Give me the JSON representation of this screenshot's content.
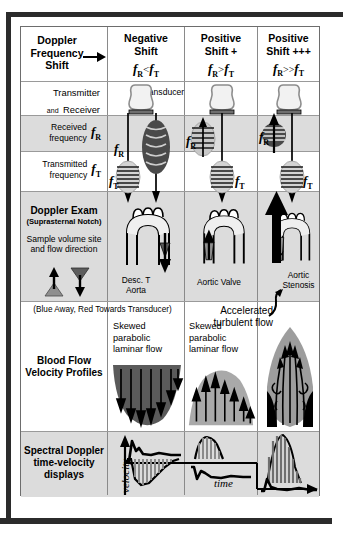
{
  "figure": {
    "title_cell": "Doppler Frequency Shift",
    "title_line1": "Doppler",
    "title_line2": "Frequency",
    "title_line3": "Shift",
    "arrow_icon": "right-arrow"
  },
  "columns": [
    {
      "id": "negative",
      "header_line1": "Negative",
      "header_line2": "Shift",
      "formula": "fR < fT",
      "formula_f1": "f",
      "formula_sub1": "R",
      "formula_op": "<",
      "formula_f2": "f",
      "formula_sub2": "T",
      "anatomy_label": "Desc. T Aorta",
      "anatomy_label_line1": "Desc. T",
      "anatomy_label_line2": "Aorta",
      "profile_line1": "Skewed",
      "profile_line2": "parabolic",
      "profile_line3": "laminar flow",
      "flow_direction": "away",
      "envelope_color": "#585858"
    },
    {
      "id": "positive",
      "header_line1": "Positive",
      "header_line2": "Shift +",
      "formula": "fR > fT",
      "formula_f1": "f",
      "formula_sub1": "R",
      "formula_op": ">",
      "formula_f2": "f",
      "formula_sub2": "T",
      "anatomy_label": "Aortic Valve",
      "anatomy_label_line1": "Aortic Valve",
      "anatomy_label_line2": "",
      "profile_line1": "Skewed",
      "profile_line2": "parabolic",
      "profile_line3": "laminar flow",
      "flow_direction": "towards",
      "envelope_color": "#a8a8a8"
    },
    {
      "id": "positive-plus",
      "header_line1": "Positive",
      "header_line2": "Shift +++",
      "formula": "fR >> fT",
      "formula_f1": "f",
      "formula_sub1": "R",
      "formula_op": ">>",
      "formula_f2": "f",
      "formula_sub2": "T",
      "anatomy_label": "Aortic Stenosis",
      "anatomy_label_line1": "Aortic",
      "anatomy_label_line2": "Stenosis",
      "profile_line1": "",
      "profile_line2": "",
      "profile_line3": "",
      "flow_direction": "towards-accelerated",
      "envelope_color": "#a8a8a8"
    }
  ],
  "rows": [
    {
      "id": "transmitter-receiver",
      "label_line1": "Transmitter",
      "label_small": "and",
      "label_line2": "Receiver",
      "inline_note": "Transducer"
    },
    {
      "id": "received-frequency",
      "label_line1": "Received",
      "label_line2": "frequency",
      "symbol_f": "f",
      "symbol_sub": "R"
    },
    {
      "id": "transmitted-frequency",
      "label_line1": "Transmitted",
      "label_line2": "frequency",
      "symbol_f": "f",
      "symbol_sub": "T"
    },
    {
      "id": "doppler-exam",
      "label_line1": "Doppler Exam",
      "label_line2": "(Suprasternal Notch)",
      "label_line3": "Sample volume site",
      "label_line4": "and flow direction",
      "legend": "(Blue Away, Red Towards Transducer)"
    },
    {
      "id": "blood-flow-velocity-profiles",
      "label_line1": "Blood Flow",
      "label_line2": "Velocity Profiles"
    },
    {
      "id": "spectral-doppler",
      "label_line1": "Spectral Doppler",
      "label_line2": "time-velocity",
      "label_line3": "displays",
      "axis_y": "velocity",
      "axis_x": "time"
    }
  ],
  "annotations": {
    "accelerated_line1": "Accelerated",
    "accelerated_line2": "turbulent flow",
    "transducer": "Transducer"
  },
  "colors": {
    "frame": "#2b2b2b",
    "band": "#dcdcdc",
    "grid": "#8a8a8a",
    "dark_flow": "#585858",
    "light_flow": "#a8a8a8",
    "vessel_gray": "#9b9b9b",
    "ink": "#000000",
    "paper": "#ffffff"
  }
}
